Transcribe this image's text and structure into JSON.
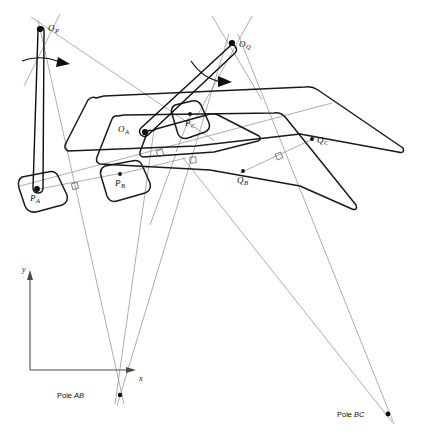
{
  "figure": {
    "domain": "Diagram",
    "width": 421,
    "height": 443,
    "background_color": "#ffffff"
  },
  "colors": {
    "body_outline": "#1a1a1a",
    "crank_link": "#0d0d0d",
    "construction_line": "#8a8a8a",
    "point_marker": "#0d0d0d",
    "label_text": "#111111",
    "axis_line": "#4a4a4a"
  },
  "labels": {
    "o_p": {
      "base": "O",
      "sub": "P"
    },
    "o_q": {
      "base": "O",
      "sub": "Q"
    },
    "o_a": {
      "base": "O",
      "sub": "A"
    },
    "p_a": {
      "base": "P",
      "sub": "A"
    },
    "p_b": {
      "base": "P",
      "sub": "B"
    },
    "p_c": {
      "base": "P",
      "sub": "C"
    },
    "q_b": {
      "base": "Q",
      "sub": "B"
    },
    "q_c": {
      "base": "Q",
      "sub": "C"
    },
    "pole_ab": {
      "prefix": "Pole ",
      "name": "AB"
    },
    "pole_bc": {
      "prefix": "Pole ",
      "name": "BC"
    },
    "axis_x": "x",
    "axis_y": "y"
  },
  "points": {
    "o_p": {
      "x": 40,
      "y": 29,
      "label_dx": 8,
      "label_dy": 2,
      "big": true
    },
    "o_q": {
      "x": 232,
      "y": 43,
      "label_dx": 7,
      "label_dy": 4,
      "big": true
    },
    "o_a": {
      "x": 144,
      "y": 132,
      "label_dx": -24,
      "label_dy": 0,
      "big": true
    },
    "p_a": {
      "x": 36,
      "y": 189,
      "label_dx": -4,
      "label_dy": 12,
      "big": true
    },
    "p_b": {
      "x": 120,
      "y": 174,
      "label_dx": -3,
      "label_dy": 12,
      "big": false
    },
    "p_c": {
      "x": 190,
      "y": 114,
      "label_dx": -3,
      "label_dy": 12,
      "big": false
    },
    "q_b": {
      "x": 243,
      "y": 171,
      "label_dx": -4,
      "label_dy": 12,
      "big": false
    },
    "q_c": {
      "x": 312,
      "y": 139,
      "label_dx": 5,
      "label_dy": 3,
      "big": false
    },
    "pole_ab": {
      "x": 120,
      "y": 395,
      "label_dx": -63,
      "label_dy": 2,
      "big": false
    },
    "pole_bc": {
      "x": 388,
      "y": 414,
      "label_dx": -51,
      "label_dy": 1,
      "big": false
    }
  },
  "axes": {
    "origin_x": 30,
    "origin_y": 370,
    "x_end": 135,
    "y_end": 272,
    "x_label_pos": {
      "x": 139,
      "y": 381
    },
    "y_label_pos": {
      "x": 24,
      "y": 271
    }
  },
  "construction_lines": [
    {
      "name": "pa-pb-perp-bisector-to-pole-ab",
      "x1": 20,
      "y1": 186,
      "x2": 330,
      "y2": 103
    },
    {
      "name": "op-to-pole-ab-left",
      "x1": 38,
      "y1": 22,
      "x2": 123,
      "y2": 400
    },
    {
      "name": "oa-ray-to-pole-ab",
      "x1": 152,
      "y1": 131,
      "x2": 116,
      "y2": 400
    },
    {
      "name": "oq-ray-to-pole-ab",
      "x1": 228,
      "y1": 36,
      "x2": 118,
      "y2": 401
    },
    {
      "name": "oq-ray-down-right",
      "x1": 236,
      "y1": 36,
      "x2": 392,
      "y2": 420
    },
    {
      "name": "center-ray-to-pole-bc",
      "x1": 185,
      "y1": 160,
      "x2": 390,
      "y2": 418
    },
    {
      "name": "qb-qc-line-to-pole-bc",
      "x1": 243,
      "y1": 171,
      "x2": 312,
      "y2": 139
    },
    {
      "name": "pa-pb-connector",
      "x1": 36,
      "y1": 189,
      "x2": 120,
      "y2": 174
    },
    {
      "name": "op-diagonal-to-right",
      "x1": 33,
      "y1": 20,
      "x2": 300,
      "y2": 200
    },
    {
      "name": "oq-short-cross",
      "x1": 213,
      "y1": 20,
      "x2": 258,
      "y2": 96
    }
  ],
  "right_angle_markers": [
    {
      "name": "ra-pa-pb",
      "x": 75,
      "y": 186,
      "angle": -12
    },
    {
      "name": "ra-center",
      "x": 160,
      "y": 154,
      "angle": -15
    },
    {
      "name": "ra-mid",
      "x": 193,
      "y": 161,
      "angle": -8
    },
    {
      "name": "ra-qb-qc",
      "x": 279,
      "y": 156,
      "angle": -25
    }
  ],
  "rotation_arrows": [
    {
      "name": "omega-p",
      "cx": 55,
      "cy": 63,
      "label": ""
    },
    {
      "name": "omega-q",
      "cx": 215,
      "cy": 74,
      "label": ""
    }
  ],
  "bodies": [
    {
      "name": "body-position-A",
      "role": "coupler body first position"
    },
    {
      "name": "body-position-B",
      "role": "coupler body second position"
    },
    {
      "name": "body-position-C",
      "role": "coupler body third position"
    }
  ],
  "links": [
    {
      "name": "crank-op-pa",
      "from": "o_p",
      "to": "p_a"
    },
    {
      "name": "crank-oq-oa",
      "from": "o_q",
      "to": "o_a"
    }
  ]
}
